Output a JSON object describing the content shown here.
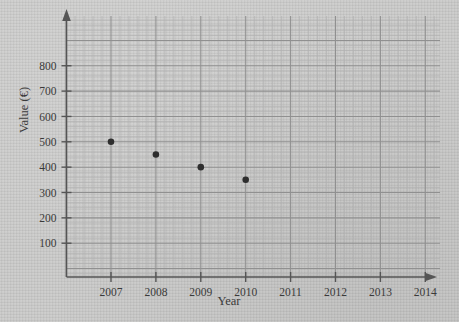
{
  "chart_data": {
    "type": "scatter",
    "title": "",
    "xlabel": "Year",
    "ylabel": "Value (€)",
    "x": [
      2007,
      2008,
      2009,
      2010
    ],
    "values": [
      500,
      450,
      400,
      350
    ],
    "points": [
      {
        "x": 2007,
        "y": 500
      },
      {
        "x": 2008,
        "y": 450
      },
      {
        "x": 2009,
        "y": 400
      },
      {
        "x": 2010,
        "y": 350
      }
    ],
    "xtick_labels": [
      "2007",
      "2008",
      "2009",
      "2010",
      "2011",
      "2012",
      "2013",
      "2014"
    ],
    "ytick_labels": [
      "100",
      "200",
      "300",
      "400",
      "500",
      "600",
      "700",
      "800"
    ],
    "ytick_values": [
      100,
      200,
      300,
      400,
      500,
      600,
      700,
      800
    ],
    "xlim": [
      2006.0,
      2014.7
    ],
    "ylim": [
      0,
      860
    ],
    "grid": true,
    "grid_minor": true,
    "legend": "none",
    "marker": "filled-circle",
    "marker_color": "#2e2e2e",
    "grid_minor_color": "#b2b2b2",
    "grid_major_color": "#909090",
    "axis_color": "#555555",
    "background_color": "#c9c9c8"
  }
}
